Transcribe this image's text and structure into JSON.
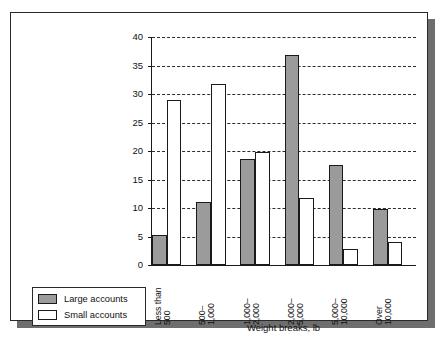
{
  "chart_data": {
    "type": "bar",
    "title": "",
    "xlabel": "Weight breaks, lb",
    "ylabel": "Percent of shipments",
    "ylim": [
      0,
      40
    ],
    "yticks": [
      0,
      5,
      10,
      15,
      20,
      25,
      30,
      35,
      40
    ],
    "grid": "horizontal-dashed",
    "legend_position": "bottom-left-outside",
    "categories": [
      "Less than 500",
      "500–1,000",
      "1,000–2,000",
      "2,000–5,000",
      "5,000–10,000",
      "Over 10,000"
    ],
    "category_lines": [
      {
        "l1": "Less than",
        "l2": "500"
      },
      {
        "l1": "500–",
        "l2": "1,000"
      },
      {
        "l1": "1,000–",
        "l2": "2,000"
      },
      {
        "l1": "2,000–",
        "l2": "5,000"
      },
      {
        "l1": "5,000–",
        "l2": "10,000"
      },
      {
        "l1": "Over",
        "l2": "10,000"
      }
    ],
    "series": [
      {
        "name": "Large accounts",
        "color": "#9b9b9b",
        "values": [
          5.2,
          11.0,
          18.6,
          36.8,
          17.6,
          9.8
        ]
      },
      {
        "name": "Small accounts",
        "color": "#ffffff",
        "values": [
          29.0,
          31.8,
          19.8,
          11.7,
          2.8,
          4.0
        ]
      }
    ]
  },
  "legend": {
    "items": [
      {
        "label": "Large accounts",
        "swatch": "large"
      },
      {
        "label": "Small accounts",
        "swatch": "small"
      }
    ]
  },
  "colors": {
    "large_accounts": "#9b9b9b",
    "small_accounts": "#ffffff",
    "axis": "#1a1a1a",
    "frame": "#2a2a2a",
    "shadow": "#6e6e6e"
  }
}
